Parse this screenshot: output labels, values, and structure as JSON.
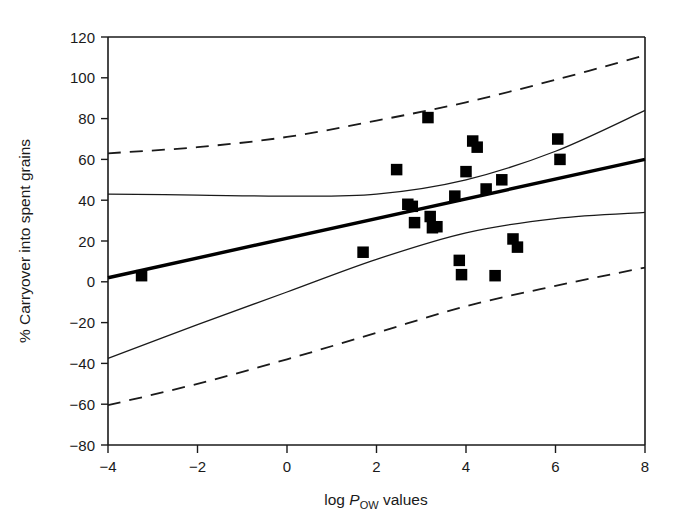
{
  "figure": {
    "background_color": "#ffffff",
    "line_color": "#1a1a1a",
    "marker_color": "#000000"
  },
  "chart_data": {
    "type": "scatter",
    "title": "",
    "xlabel": "log P_OW values",
    "xlabel_parts": {
      "prefix": "log ",
      "italic": "P",
      "subscript": "OW",
      "suffix": " values"
    },
    "ylabel": "% Carryover into spent grains",
    "xlim": [
      -4,
      8
    ],
    "ylim": [
      -80,
      120
    ],
    "xticks": [
      -4,
      -2,
      0,
      2,
      4,
      6,
      8
    ],
    "xtick_labels": [
      "−4",
      "−2",
      "0",
      "2",
      "4",
      "6",
      "8"
    ],
    "yticks": [
      -80,
      -60,
      -40,
      -20,
      0,
      20,
      40,
      60,
      80,
      100,
      120
    ],
    "ytick_labels": [
      "−80",
      "−60",
      "−40",
      "−20",
      "0",
      "20",
      "40",
      "60",
      "80",
      "100",
      "120"
    ],
    "grid": false,
    "legend": null,
    "points": [
      {
        "x": -3.25,
        "y": 3
      },
      {
        "x": 1.7,
        "y": 14.5
      },
      {
        "x": 2.45,
        "y": 55
      },
      {
        "x": 2.7,
        "y": 38
      },
      {
        "x": 2.8,
        "y": 37
      },
      {
        "x": 2.85,
        "y": 29
      },
      {
        "x": 3.15,
        "y": 80.5
      },
      {
        "x": 3.2,
        "y": 32
      },
      {
        "x": 3.25,
        "y": 26.5
      },
      {
        "x": 3.35,
        "y": 27
      },
      {
        "x": 3.75,
        "y": 42
      },
      {
        "x": 3.85,
        "y": 10.5
      },
      {
        "x": 3.9,
        "y": 3.5
      },
      {
        "x": 4.0,
        "y": 54
      },
      {
        "x": 4.15,
        "y": 69
      },
      {
        "x": 4.25,
        "y": 66
      },
      {
        "x": 4.45,
        "y": 45.5
      },
      {
        "x": 4.65,
        "y": 3
      },
      {
        "x": 4.8,
        "y": 50
      },
      {
        "x": 5.05,
        "y": 21
      },
      {
        "x": 5.15,
        "y": 17
      },
      {
        "x": 6.05,
        "y": 70
      },
      {
        "x": 6.1,
        "y": 60
      }
    ],
    "series": [
      {
        "name": "regression-line",
        "style": "solid-thick",
        "x": [
          -4,
          8
        ],
        "y": [
          2,
          60
        ]
      },
      {
        "name": "confidence-band-upper",
        "style": "solid-thin",
        "x": [
          -4,
          -2,
          0,
          2,
          4,
          6,
          8
        ],
        "y": [
          43,
          42.5,
          42,
          43,
          50,
          64,
          84
        ]
      },
      {
        "name": "confidence-band-lower",
        "style": "solid-thin",
        "x": [
          -4,
          -2,
          0,
          2,
          4,
          6,
          8
        ],
        "y": [
          -37.5,
          -21,
          -5,
          11,
          24,
          31,
          34
        ]
      },
      {
        "name": "prediction-band-upper",
        "style": "dashed",
        "x": [
          -4,
          -2,
          0,
          2,
          4,
          6,
          8
        ],
        "y": [
          63,
          66,
          71,
          79,
          88,
          99,
          111
        ]
      },
      {
        "name": "prediction-band-lower",
        "style": "dashed",
        "x": [
          -4,
          -2,
          0,
          2,
          4,
          6,
          8
        ],
        "y": [
          -60.5,
          -50,
          -38,
          -25,
          -12,
          -2,
          7
        ]
      }
    ]
  }
}
